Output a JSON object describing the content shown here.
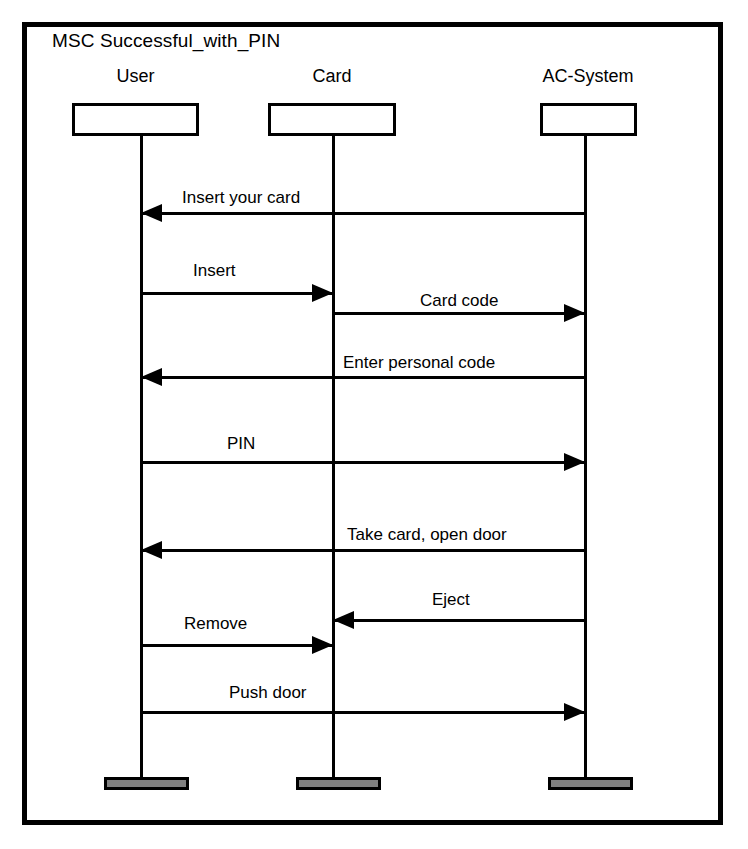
{
  "diagram": {
    "kind": "msc-sequence-diagram",
    "title": "MSC Successful_with_PIN",
    "colors": {
      "stroke": "#000000",
      "background": "#ffffff",
      "terminator_fill": "#808080"
    },
    "lifelines": [
      {
        "id": "user",
        "label": "User",
        "x": 141,
        "box_left": 72,
        "box_width": 127,
        "name_left": 72,
        "name_top": 66
      },
      {
        "id": "card",
        "label": "Card",
        "x": 333,
        "box_left": 268,
        "box_width": 128,
        "name_left": 268,
        "name_top": 66
      },
      {
        "id": "acsystem",
        "label": "AC-System",
        "x": 585,
        "box_left": 540,
        "box_width": 97,
        "name_left": 518,
        "name_top": 66
      }
    ],
    "lifeline_box": {
      "top": 103,
      "height": 33
    },
    "lifeline_stem": {
      "top": 136,
      "bottom": 779
    },
    "terminators": [
      {
        "id": "user-terminator",
        "left": 104,
        "width": 85,
        "top": 777
      },
      {
        "id": "card-terminator",
        "left": 296,
        "width": 85,
        "top": 777
      },
      {
        "id": "acsystem-terminator",
        "left": 548,
        "width": 85,
        "top": 777
      }
    ],
    "messages": [
      {
        "id": "m1",
        "label": "Insert your card",
        "from": "acsystem",
        "to": "user",
        "direction": "left",
        "y": 213,
        "label_left": 182,
        "label_top": 188
      },
      {
        "id": "m2",
        "label": "Insert",
        "from": "user",
        "to": "card",
        "direction": "right",
        "y": 293,
        "label_left": 193,
        "label_top": 261
      },
      {
        "id": "m3",
        "label": "Card code",
        "from": "card",
        "to": "acsystem",
        "direction": "right",
        "y": 313,
        "label_left": 420,
        "label_top": 291
      },
      {
        "id": "m4",
        "label": "Enter personal code",
        "from": "acsystem",
        "to": "user",
        "direction": "left",
        "y": 377,
        "label_left": 343,
        "label_top": 353
      },
      {
        "id": "m5",
        "label": "PIN",
        "from": "user",
        "to": "acsystem",
        "direction": "right",
        "y": 462,
        "label_left": 227,
        "label_top": 434
      },
      {
        "id": "m6",
        "label": "Take card, open door",
        "from": "acsystem",
        "to": "user",
        "direction": "left",
        "y": 550,
        "label_left": 347,
        "label_top": 525
      },
      {
        "id": "m7",
        "label": "Eject",
        "from": "acsystem",
        "to": "card",
        "direction": "left",
        "y": 620,
        "label_left": 432,
        "label_top": 590
      },
      {
        "id": "m8",
        "label": "Remove",
        "from": "user",
        "to": "card",
        "direction": "right",
        "y": 645,
        "label_left": 184,
        "label_top": 614
      },
      {
        "id": "m9",
        "label": "Push door",
        "from": "user",
        "to": "acsystem",
        "direction": "right",
        "y": 712,
        "label_left": 229,
        "label_top": 683
      }
    ]
  }
}
